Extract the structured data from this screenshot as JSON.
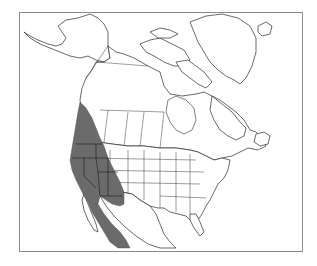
{
  "map": {
    "type": "species range map",
    "region": "North America",
    "range_fill_color": "#6b6b6b",
    "land_fill_color": "#ffffff",
    "outline_color": "#2a2a2a",
    "frame_color": "#8a8a8a",
    "range_description": "Shaded distribution across western North America: southern British Columbia, Washington, Oregon, California, Idaho, Nevada, Utah, western Montana and Wyoming, Arizona, western New Mexico, and Baja California / northwestern Mexico"
  }
}
